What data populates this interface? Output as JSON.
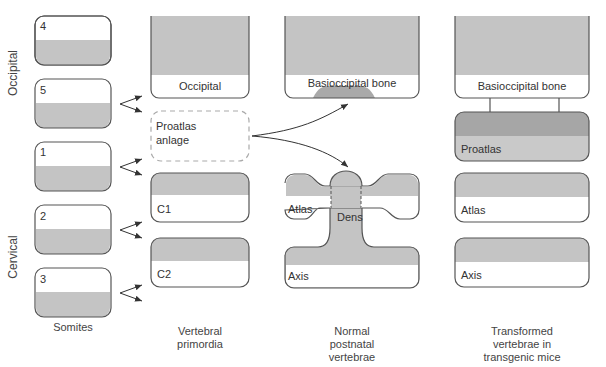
{
  "side_labels": {
    "occipital": "Occipital",
    "cervical": "Cervical"
  },
  "somites": {
    "items": [
      {
        "number": "4"
      },
      {
        "number": "5"
      },
      {
        "number": "1"
      },
      {
        "number": "2"
      },
      {
        "number": "3"
      }
    ],
    "caption": "Somites"
  },
  "vertebral_primordia": {
    "occipital": "Occipital",
    "proatlas_anlage_line1": "Proatlas",
    "proatlas_anlage_line2": "anlage",
    "c1": "C1",
    "c2": "C2",
    "caption_line1": "Vertebral",
    "caption_line2": "primordia"
  },
  "normal_postnatal": {
    "basioccipital": "Basioccipital bone",
    "atlas": "Atlas",
    "dens": "Dens",
    "axis": "Axis",
    "caption_line1": "Normal",
    "caption_line2": "postnatal",
    "caption_line3": "vertebrae"
  },
  "transgenic": {
    "basioccipital": "Basioccipital bone",
    "proatlas": "Proatlas",
    "atlas": "Atlas",
    "axis": "Axis",
    "caption_line1": "Transformed",
    "caption_line2": "vertebrae in",
    "caption_line3": "transgenic mice"
  },
  "colors": {
    "bone_gray": "#c4c4c4",
    "proatlas_dark": "#a6a6a6",
    "proatlas_light": "#c9c9c9",
    "outline": "#555555"
  }
}
